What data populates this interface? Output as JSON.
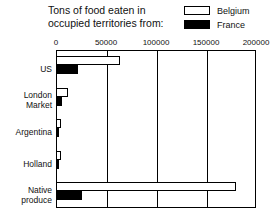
{
  "chart_data": {
    "type": "bar",
    "orientation": "horizontal",
    "title": "Tons of food eaten in\noccupied territories from:",
    "xlabel": "",
    "ylabel": "",
    "xlim": [
      0,
      200000
    ],
    "grid": true,
    "legend_position": "top-right",
    "xticks": [
      0,
      50000,
      100000,
      150000,
      200000
    ],
    "xtick_labels": [
      "0",
      "50000",
      "100000",
      "150000",
      "200000"
    ],
    "categories": [
      "US",
      "London\nMarket",
      "Argentina",
      "Holland",
      "Native\nproduce"
    ],
    "series": [
      {
        "name": "Belgium",
        "color": "#ffffff",
        "edge_color": "#000000",
        "values": [
          64000,
          12000,
          5000,
          5000,
          180000
        ]
      },
      {
        "name": "France",
        "color": "#000000",
        "edge_color": "#000000",
        "values": [
          22000,
          6000,
          3000,
          3000,
          26000
        ]
      }
    ]
  },
  "legend": {
    "items": [
      {
        "label": "Belgium",
        "swatch": "belgium"
      },
      {
        "label": "France",
        "swatch": "france"
      }
    ]
  },
  "colors": {
    "belgium": "#ffffff",
    "france": "#000000",
    "axis": "#000000",
    "text": "#111111",
    "background": "#ffffff"
  }
}
